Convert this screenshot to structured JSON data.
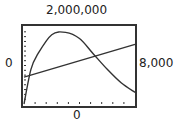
{
  "window": {
    "ymax_label": "2,000,000",
    "ymin_label": "0",
    "xmin_label": "0",
    "xmax_label": "8,000"
  },
  "chart_data": {
    "type": "line",
    "title": "",
    "xlabel": "",
    "ylabel": "",
    "xlim": [
      0,
      8000
    ],
    "ylim": [
      0,
      2000000
    ],
    "grid": false,
    "x_ticks": 10,
    "y_ticks": 16,
    "series": [
      {
        "name": "curve",
        "x": [
          0,
          500,
          1000,
          2000,
          3000,
          4000,
          5000,
          6000,
          7000,
          8000
        ],
        "y": [
          0,
          900000,
          1300000,
          1800000,
          1860000,
          1700000,
          1300000,
          900000,
          550000,
          300000
        ]
      },
      {
        "name": "line",
        "x": [
          0,
          8000
        ],
        "y": [
          700000,
          1550000
        ]
      }
    ]
  }
}
